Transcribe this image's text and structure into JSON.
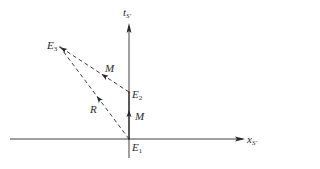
{
  "diagram": {
    "type": "spacetime-diagram",
    "axes": {
      "horizontal": {
        "label_main": "x",
        "label_sub": "S'"
      },
      "vertical": {
        "label_main": "t",
        "label_sub": "S'"
      }
    },
    "events": [
      {
        "id": "E1",
        "label_main": "E",
        "label_sub": "1"
      },
      {
        "id": "E2",
        "label_main": "E",
        "label_sub": "2"
      },
      {
        "id": "E3",
        "label_main": "E",
        "label_sub": "3"
      }
    ],
    "vectors": [
      {
        "from": "E1",
        "to": "E2",
        "style": "solid",
        "label": "M"
      },
      {
        "from": "E2",
        "to": "E3",
        "style": "dashed",
        "label": "M"
      },
      {
        "from": "E1",
        "to": "E3",
        "style": "dashed",
        "label": "R"
      }
    ],
    "colors": {
      "line": "#2a2a2a",
      "background": "#ffffff"
    }
  }
}
